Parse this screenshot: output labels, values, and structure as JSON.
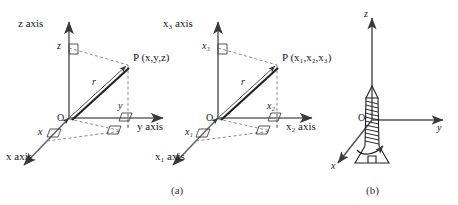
{
  "figure": {
    "background": "#ffffff",
    "ink": "#3a3a3a",
    "dash_color": "#6b6b6b"
  },
  "panels": [
    {
      "id": "panel-a-left",
      "caption": "(a)",
      "type": "cartesian-3d-coordinate-axes",
      "origin_label": "O",
      "vector_label": "r",
      "point_label": "P (x,y,z)",
      "axes": [
        {
          "name": "z-axis",
          "label": "z axis",
          "direction": "up"
        },
        {
          "name": "y-axis",
          "label": "y axis",
          "direction": "right"
        },
        {
          "name": "x-axis",
          "label": "x axis",
          "direction": "down-left"
        }
      ],
      "projection_labels": [
        {
          "name": "z-projection",
          "label": "z"
        },
        {
          "name": "y-projection",
          "label": "y"
        },
        {
          "name": "x-projection",
          "label": "x"
        }
      ]
    },
    {
      "id": "panel-a-right",
      "caption": "(a)",
      "type": "indexed-3d-coordinate-axes",
      "origin_label": "O",
      "vector_label": "r",
      "point_label": "P (x₁,x₂,x₃)",
      "axes": [
        {
          "name": "x3-axis",
          "label": "x₃ axis",
          "direction": "up"
        },
        {
          "name": "x2-axis",
          "label": "x₂ axis",
          "direction": "right"
        },
        {
          "name": "x1-axis",
          "label": "x₁ axis",
          "direction": "down-left"
        }
      ],
      "projection_labels": [
        {
          "name": "x3-projection",
          "label": "x₃"
        },
        {
          "name": "x2-projection",
          "label": "x₂"
        },
        {
          "name": "x1-projection",
          "label": "x₁"
        }
      ]
    },
    {
      "id": "panel-b",
      "caption": "(b)",
      "type": "right-hand-screw-rule",
      "origin_label": "O",
      "axes": [
        {
          "name": "z-axis",
          "label": "z",
          "direction": "up"
        },
        {
          "name": "y-axis",
          "label": "y",
          "direction": "right"
        },
        {
          "name": "x-axis",
          "label": "x",
          "direction": "down-left"
        }
      ],
      "screw": {
        "name": "screw-illustration",
        "rotation_arrow": "counterclockwise-curved-arrow"
      }
    }
  ],
  "captions": {
    "a": "(a)",
    "b": "(b)"
  }
}
